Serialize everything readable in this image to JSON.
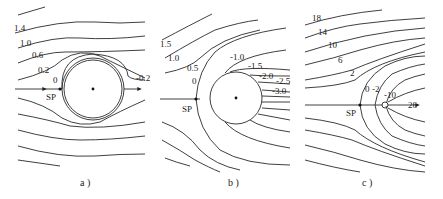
{
  "figure": {
    "panels": [
      {
        "id": "a",
        "caption": "a )",
        "stagnation_label": "SP",
        "streamline_labels": [
          "1.4",
          "1.0",
          "0.6",
          "0.2",
          "0",
          "-0.2"
        ]
      },
      {
        "id": "b",
        "caption": "b )",
        "stagnation_label": "SP",
        "streamline_labels": [
          "1.5",
          "1.0",
          "0.5",
          "0",
          "-1.0",
          "-1.5",
          "-2.0",
          "-2.5",
          "-3.0"
        ]
      },
      {
        "id": "c",
        "caption": "c )",
        "stagnation_label": "SP",
        "streamline_labels": [
          "18",
          "14",
          "10",
          "6",
          "2",
          "0",
          "-2",
          "-10",
          "26"
        ]
      }
    ],
    "colors": {
      "line": "#2a2a2a",
      "background": "#ffffff"
    }
  }
}
